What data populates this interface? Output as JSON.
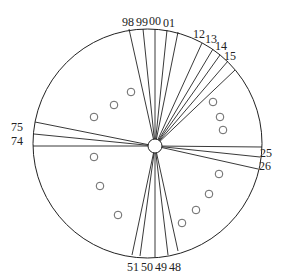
{
  "diagram": {
    "type": "circular radial sector diagram",
    "outer_circle": {
      "cx": 147.5,
      "cy": 143.5,
      "r": 114.5
    },
    "hub": {
      "cx": 155,
      "cy": 146,
      "r": 7
    },
    "rays": [
      {
        "x": 129,
        "y": 29
      },
      {
        "x": 143,
        "y": 29
      },
      {
        "x": 155,
        "y": 29
      },
      {
        "x": 167,
        "y": 30
      },
      {
        "x": 178,
        "y": 32
      },
      {
        "x": 202,
        "y": 43
      },
      {
        "x": 213,
        "y": 49
      },
      {
        "x": 220,
        "y": 55
      },
      {
        "x": 228,
        "y": 61
      },
      {
        "x": 235,
        "y": 70
      },
      {
        "x": 262,
        "y": 147
      },
      {
        "x": 260,
        "y": 157
      },
      {
        "x": 258,
        "y": 169
      },
      {
        "x": 178,
        "y": 251
      },
      {
        "x": 168,
        "y": 255
      },
      {
        "x": 155,
        "y": 257
      },
      {
        "x": 140,
        "y": 256
      },
      {
        "x": 132,
        "y": 255
      },
      {
        "x": 33,
        "y": 146
      },
      {
        "x": 34,
        "y": 134
      },
      {
        "x": 35,
        "y": 122
      }
    ],
    "labels": [
      {
        "text": "98",
        "x": 128,
        "y": 26
      },
      {
        "text": "99",
        "x": 142,
        "y": 26
      },
      {
        "text": "00",
        "x": 155,
        "y": 25
      },
      {
        "text": "01",
        "x": 169,
        "y": 27
      },
      {
        "text": "12",
        "x": 199,
        "y": 38
      },
      {
        "text": "13",
        "x": 211,
        "y": 43
      },
      {
        "text": "14",
        "x": 221,
        "y": 50
      },
      {
        "text": "15",
        "x": 230,
        "y": 60
      },
      {
        "text": "25",
        "x": 266,
        "y": 157
      },
      {
        "text": "26",
        "x": 265,
        "y": 170
      },
      {
        "text": "75",
        "x": 17,
        "y": 131
      },
      {
        "text": "74",
        "x": 17,
        "y": 145
      },
      {
        "text": "51",
        "x": 133,
        "y": 271
      },
      {
        "text": "50",
        "x": 147,
        "y": 271
      },
      {
        "text": "49",
        "x": 161,
        "y": 271
      },
      {
        "text": "48",
        "x": 175,
        "y": 271
      }
    ],
    "small_circles": [
      {
        "cx": 131,
        "cy": 92
      },
      {
        "cx": 114,
        "cy": 105
      },
      {
        "cx": 94,
        "cy": 117
      },
      {
        "cx": 213,
        "cy": 102
      },
      {
        "cx": 220,
        "cy": 117
      },
      {
        "cx": 223,
        "cy": 130
      },
      {
        "cx": 94,
        "cy": 157
      },
      {
        "cx": 100,
        "cy": 186
      },
      {
        "cx": 118,
        "cy": 215
      },
      {
        "cx": 219,
        "cy": 174
      },
      {
        "cx": 209,
        "cy": 194
      },
      {
        "cx": 196,
        "cy": 210
      },
      {
        "cx": 182,
        "cy": 223
      }
    ],
    "small_circle_r": 3.8
  }
}
